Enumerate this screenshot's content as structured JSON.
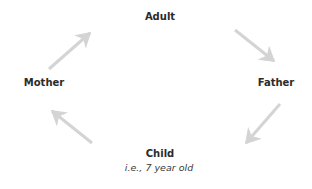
{
  "diagram": {
    "type": "cycle",
    "nodes": {
      "adult": {
        "label": "Adult"
      },
      "father": {
        "label": "Father"
      },
      "child": {
        "label": "Child",
        "sublabel": "i.e., 7 year old"
      },
      "mother": {
        "label": "Mother"
      }
    },
    "edges": [
      {
        "from": "Adult",
        "to": "Father"
      },
      {
        "from": "Father",
        "to": "Child"
      },
      {
        "from": "Child",
        "to": "Mother"
      },
      {
        "from": "Mother",
        "to": "Adult"
      }
    ],
    "colors": {
      "text": "#2b2b2b",
      "arrow": "#d4d4d4"
    }
  }
}
